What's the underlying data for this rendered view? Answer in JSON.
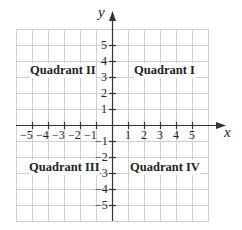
{
  "diagram": {
    "axes": {
      "x_label": "x",
      "y_label": "y"
    },
    "x_ticks": [
      "−5",
      "−4",
      "−3",
      "−2",
      "−1",
      "1",
      "2",
      "3",
      "4",
      "5"
    ],
    "y_ticks": [
      "5",
      "4",
      "3",
      "2",
      "1",
      "−1",
      "−2",
      "−3",
      "−4",
      "−5"
    ],
    "quadrants": {
      "q1": "Quadrant I",
      "q2": "Quadrant II",
      "q3": "Quadrant III",
      "q4": "Quadrant IV"
    },
    "colors": {
      "grid": "#cfcfcf",
      "axis": "#333333",
      "text": "#222222"
    }
  }
}
